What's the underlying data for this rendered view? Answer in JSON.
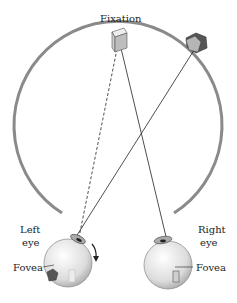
{
  "diagram": {
    "labels": {
      "fixation": "Fixation",
      "left_eye_line1": "Left",
      "left_eye_line2": "eye",
      "right_eye_line1": "Right",
      "right_eye_line2": "eye",
      "fovea_left": "Fovea",
      "fovea_right": "Fovea"
    },
    "objects": [
      {
        "name": "fixation-object",
        "shape": "rectangular-block",
        "color": "#d8d8d8"
      },
      {
        "name": "peripheral-object",
        "shape": "pentagon",
        "color": "#9a9a9a"
      }
    ],
    "colors": {
      "horopter_arc": "#8a8a8a",
      "eye_fill": "#e6e6e6",
      "line": "#222222"
    },
    "rotation_arrow": "clockwise-down"
  }
}
